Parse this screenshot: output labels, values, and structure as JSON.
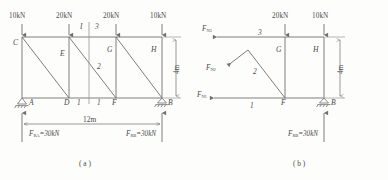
{
  "figure": {
    "caption_a": "( a )",
    "caption_b": "( b )"
  },
  "diagram_a": {
    "name": "full-truss",
    "loads": [
      {
        "label": "10kN",
        "joint": "C"
      },
      {
        "label": "20kN",
        "joint": "E"
      },
      {
        "label": "20kN",
        "joint": "G"
      },
      {
        "label": "10kN",
        "joint": "H"
      }
    ],
    "joints": {
      "C": "C",
      "E": "E",
      "G": "G",
      "H": "H",
      "A": "A",
      "D": "D",
      "F": "F",
      "B": "B"
    },
    "section_label": "I",
    "member_numbers": {
      "top": "3",
      "diagonal": "2",
      "bottom_left": "1",
      "bottom_right": "1"
    },
    "dimensions": {
      "span": "12m",
      "height": "4m"
    },
    "reactions": {
      "left": "F",
      "left_sub": "RA",
      "left_value": "=30kN",
      "right": "F",
      "right_sub": "RB",
      "right_value": "=30kN"
    }
  },
  "diagram_b": {
    "name": "free-body-right-segment",
    "loads": [
      {
        "label": "20kN",
        "joint": "G"
      },
      {
        "label": "10kN",
        "joint": "H"
      }
    ],
    "joints": {
      "G": "G",
      "H": "H",
      "F": "F",
      "B": "B"
    },
    "member_forces": [
      {
        "symbol": "F",
        "sub": "N3",
        "member": "3"
      },
      {
        "symbol": "F",
        "sub": "N2",
        "member": "2"
      },
      {
        "symbol": "F",
        "sub": "N1",
        "member": "1"
      }
    ],
    "member_numbers": {
      "top": "3",
      "diagonal": "2",
      "bottom": "1"
    },
    "dimensions": {
      "height": "4m"
    },
    "reactions": {
      "right": "F",
      "right_sub": "RB",
      "right_value": "=30kN"
    }
  },
  "colors": {
    "line": "#6f6f6f",
    "text": "#4a4a4a",
    "background": "#fdfdfb"
  }
}
